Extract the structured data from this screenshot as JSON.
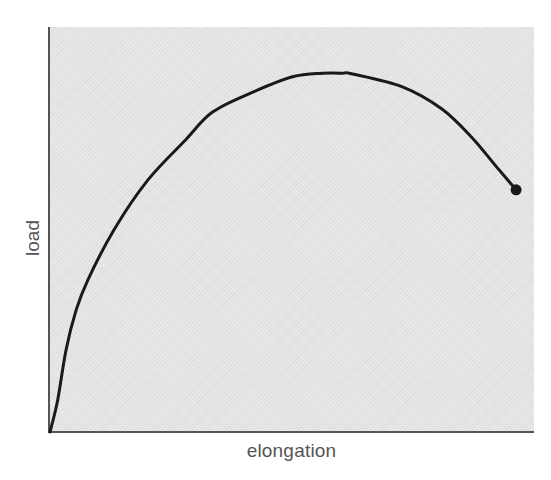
{
  "chart_data": {
    "type": "line",
    "title": "",
    "xlabel": "elongation",
    "ylabel": "load",
    "grid": false,
    "legend": null,
    "axis_ticks": "none",
    "xlim": [
      0,
      100
    ],
    "ylim": [
      0,
      100
    ],
    "series": [
      {
        "name": "load-elongation curve",
        "color": "#1a1a1a",
        "x": [
          0,
          1.6,
          3.3,
          5.4,
          7.8,
          13.2,
          20.2,
          28,
          33.6,
          41.9,
          50.1,
          56.3,
          60.4,
          62.5,
          72.8,
          80.9,
          87.1,
          92.3,
          96.3
        ],
        "y": [
          0,
          7.9,
          20.2,
          30.1,
          37.5,
          49.9,
          62.2,
          72.1,
          79,
          83.9,
          87.7,
          88.6,
          88.6,
          88.4,
          85.2,
          79.8,
          72.8,
          65.4,
          59.8
        ],
        "endpoint_marker": {
          "x": 96.3,
          "y": 59.8,
          "shape": "filled-circle",
          "label": "fracture"
        }
      }
    ],
    "annotations": []
  },
  "style": {
    "plot_background": "#e5e5e5",
    "axis_color": "#555555",
    "curve_color": "#1a1a1a",
    "label_color": "#555555"
  }
}
